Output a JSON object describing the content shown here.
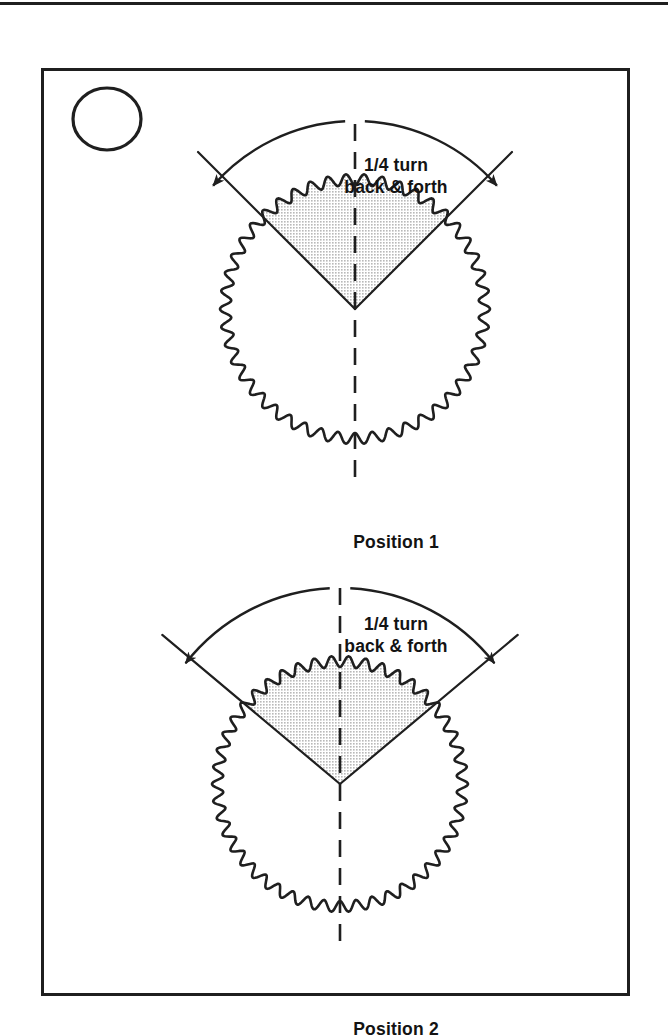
{
  "page": {
    "width": 668,
    "height": 1035,
    "background": "#ffffff",
    "ink_color": "#1f1f1f",
    "shade_color": "#e3e3e3"
  },
  "figure": {
    "step_number": "11",
    "frame": {
      "x": 41,
      "y": 68,
      "width": 589,
      "height": 928
    }
  },
  "diagrams": [
    {
      "id": "position-1",
      "turn_label": "1/4 turn\nback & forth",
      "caption": "Position 1",
      "gear": {
        "center_x": 352,
        "center_y": 306,
        "radius": 135,
        "teeth": 46,
        "tooth_depth": 11
      },
      "wedge": {
        "start_angle_deg": -135,
        "end_angle_deg": -45,
        "span_deg": 90,
        "fill": "#e3e3e3"
      },
      "arrow_arc": {
        "radius": 188,
        "start_angle_deg": -139,
        "end_angle_deg": -41,
        "double_headed": true
      },
      "radial_lines": {
        "outer_radius": 222,
        "inner_radius": 0
      },
      "centerline": {
        "angle_deg": 90,
        "style": "dashed",
        "top_extent": 185,
        "bottom_extent": 172
      }
    },
    {
      "id": "position-2",
      "turn_label": "1/4 turn\nback & forth",
      "caption": "Position 2",
      "gear": {
        "center_x": 337,
        "center_y": 781,
        "radius": 128,
        "teeth": 46,
        "tooth_depth": 11
      },
      "wedge": {
        "start_angle_deg": -140,
        "end_angle_deg": -40,
        "span_deg": 100,
        "fill": "#e3e3e3"
      },
      "arrow_arc": {
        "radius": 196,
        "start_angle_deg": -142,
        "end_angle_deg": -38,
        "double_headed": true
      },
      "radial_lines": {
        "outer_radius": 232,
        "inner_radius": 0
      },
      "centerline": {
        "angle_deg": 90,
        "style": "dashed",
        "top_extent": 196,
        "bottom_extent": 168
      }
    }
  ]
}
